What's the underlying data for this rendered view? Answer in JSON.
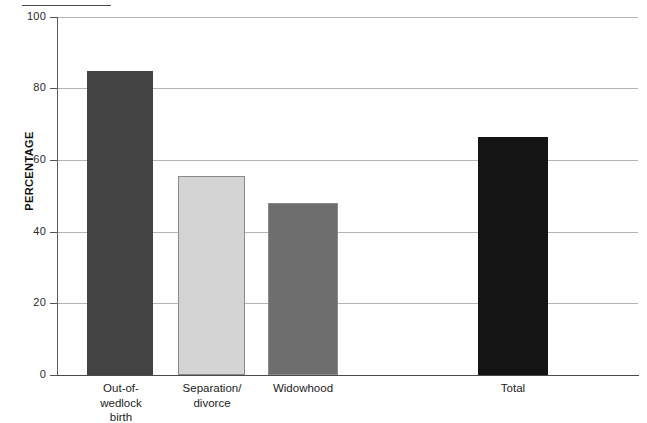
{
  "chart_data": {
    "type": "bar",
    "title": "",
    "subtitle": "",
    "xlabel": "",
    "ylabel": "PERCENTAGE",
    "ylim": [
      0,
      100
    ],
    "yticks": [
      0,
      20,
      40,
      60,
      80,
      100
    ],
    "ytick_labels": [
      "0",
      "20",
      "40",
      "60",
      "80",
      "100"
    ],
    "grid": "horizontal",
    "legend": "none",
    "categories": [
      "Out-of-wedlock birth",
      "Separation/divorce",
      "Widowhood",
      "Total"
    ],
    "category_lines": [
      [
        "Out-of-",
        "wedlock",
        "birth"
      ],
      [
        "Separation/",
        "divorce"
      ],
      [
        "Widowhood"
      ],
      [
        "Total"
      ]
    ],
    "values": [
      85,
      55.5,
      48,
      66.5
    ],
    "bar_colors": [
      "#434343",
      "#d4d4d4",
      "#6e6e6e",
      "#141414"
    ],
    "bars": [
      {
        "label": "Out-of-wedlock birth",
        "value": 85,
        "color": "#434343",
        "left": 87,
        "width": 66
      },
      {
        "label": "Separation/divorce",
        "value": 55.5,
        "color": "#d4d4d4",
        "left": 178,
        "width": 67
      },
      {
        "label": "Widowhood",
        "value": 48,
        "color": "#6e6e6e",
        "left": 268,
        "width": 70
      },
      {
        "label": "Total",
        "value": 66.5,
        "color": "#141414",
        "left": 478,
        "width": 70
      }
    ]
  },
  "axis": {
    "y_title": "PERCENTAGE",
    "tick_100": "100",
    "tick_80": "80",
    "tick_60": "60",
    "tick_40": "40",
    "tick_20": "20",
    "tick_0": "0"
  },
  "xlabels": {
    "bar1_line1": "Out-of-",
    "bar1_line2": "wedlock",
    "bar1_line3": "birth",
    "bar2_line1": "Separation/",
    "bar2_line2": "divorce",
    "bar3_line1": "Widowhood",
    "bar4_line1": "Total"
  },
  "colors": {
    "bar_out_of_wedlock": "#434343",
    "bar_separation_divorce": "#d4d4d4",
    "bar_widowhood": "#6e6e6e",
    "bar_total": "#141414",
    "gridline": "#b4b4b4",
    "axis": "#4a4a4a",
    "background": "#ffffff"
  }
}
